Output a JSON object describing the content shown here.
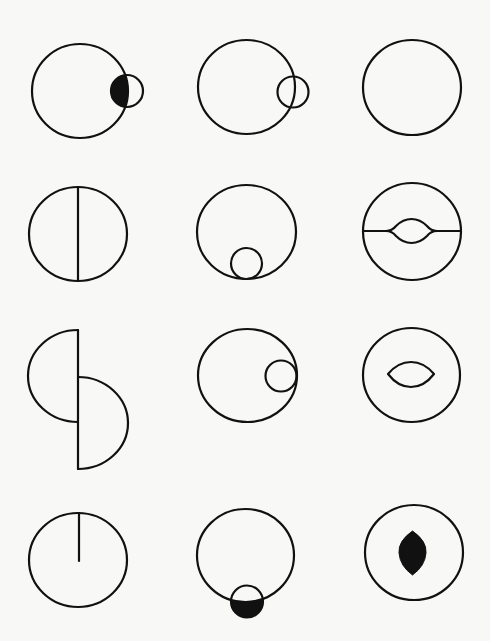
{
  "figure": {
    "background_color": "#f8f8f7",
    "stroke_color": "#111111",
    "rows": [
      {
        "row": 1,
        "cells": [
          {
            "name": "circle-with-overlapping-small-circle-filled-lens",
            "main": {
              "cx": 80,
              "cy": 91,
              "rx": 48,
              "ry": 47
            },
            "small": {
              "cx": 127,
              "cy": 91,
              "r": 16
            },
            "fill": "intersection"
          },
          {
            "name": "circle-with-overlapping-small-circle",
            "main": {
              "cx": 246.5,
              "cy": 87,
              "rx": 48.5,
              "ry": 47
            },
            "small": {
              "cx": 293,
              "cy": 92,
              "r": 15.5
            }
          },
          {
            "name": "plain-circle",
            "main": {
              "cx": 412,
              "cy": 87.5,
              "rx": 49,
              "ry": 47.5
            }
          }
        ]
      },
      {
        "row": 2,
        "cells": [
          {
            "name": "circle-with-vertical-diameter",
            "main": {
              "cx": 78,
              "cy": 234,
              "rx": 49,
              "ry": 47
            }
          },
          {
            "name": "circle-with-internal-tangent-circle-bottom",
            "main": {
              "cx": 246.5,
              "cy": 232,
              "rx": 49.5,
              "ry": 47
            },
            "small": {
              "cx": 246.5,
              "cy": 263.5,
              "r": 16
            }
          },
          {
            "name": "circle-with-horizontal-line-and-lens",
            "main": {
              "cx": 412,
              "cy": 231.5,
              "rx": 49,
              "ry": 48.5
            },
            "lens": {
              "x1": 389,
              "x2": 434,
              "cy": 231,
              "top": 219,
              "bottom": 243
            }
          }
        ]
      },
      {
        "row": 3,
        "cells": [
          {
            "name": "two-offset-semicircles",
            "line_x": 78,
            "top_semicircle": {
              "y1": 330,
              "y2": 422,
              "bulge_x": 28
            },
            "bottom_semicircle": {
              "y1": 377,
              "y2": 469,
              "bulge_x": 128
            }
          },
          {
            "name": "circle-with-internal-tangent-circle-right",
            "main": {
              "cx": 247.5,
              "cy": 375.5,
              "rx": 49.5,
              "ry": 46.5
            },
            "small": {
              "cx": 280.5,
              "cy": 376,
              "r": 16
            }
          },
          {
            "name": "circle-with-lens",
            "main": {
              "cx": 411.5,
              "cy": 375,
              "rx": 48.5,
              "ry": 47
            },
            "lens": {
              "x1": 388,
              "x2": 434,
              "cy": 374,
              "top": 362,
              "bottom": 387
            }
          }
        ]
      },
      {
        "row": 4,
        "cells": [
          {
            "name": "circle-with-radius-line",
            "main": {
              "cx": 78,
              "cy": 560,
              "rx": 49,
              "ry": 47
            },
            "radius_end_y": 561
          },
          {
            "name": "circle-with-external-small-circle-filled-outside",
            "main": {
              "cx": 245.5,
              "cy": 555.5,
              "rx": 48.5,
              "ry": 46.5
            },
            "small": {
              "cx": 247,
              "cy": 601.5,
              "r": 16
            },
            "fill": "outside-part"
          },
          {
            "name": "circle-with-filled-vertical-lens",
            "main": {
              "cx": 414,
              "cy": 552.5,
              "rx": 49,
              "ry": 47.5
            },
            "lens": {
              "cx": 412.5,
              "top": 531,
              "bottom": 575,
              "half_width": 13.5
            }
          }
        ]
      }
    ]
  }
}
